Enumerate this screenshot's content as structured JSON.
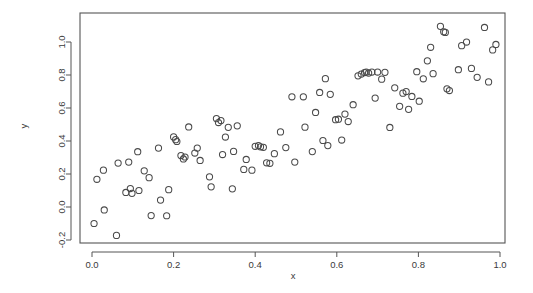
{
  "chart_data": {
    "type": "scatter",
    "title": "",
    "subtitle": "",
    "xlabel": "x",
    "ylabel": "y",
    "xlim": [
      -0.04,
      1.04
    ],
    "ylim": [
      -0.235,
      1.135
    ],
    "xticks": [
      0.0,
      0.2,
      0.4,
      0.6,
      0.8,
      1.0
    ],
    "xtick_labels": [
      "0.0",
      "0.2",
      "0.4",
      "0.6",
      "0.8",
      "1.0"
    ],
    "yticks": [
      -0.2,
      0.0,
      0.2,
      0.4,
      0.6,
      0.8,
      1.0
    ],
    "ytick_labels": [
      "-0.2",
      "0.0",
      "0.2",
      "0.4",
      "0.6",
      "0.8",
      "1.0"
    ],
    "grid": false,
    "legend": null,
    "marker": "open-circle",
    "marker_color": "#4a4a4a",
    "marker_size": 3.1,
    "frame": true,
    "annotations": [],
    "n_points": 103,
    "points": [
      [
        0.005,
        -0.1
      ],
      [
        0.012,
        0.168
      ],
      [
        0.028,
        0.223
      ],
      [
        0.03,
        -0.018
      ],
      [
        0.06,
        -0.172
      ],
      [
        0.064,
        0.266
      ],
      [
        0.083,
        0.088
      ],
      [
        0.09,
        0.272
      ],
      [
        0.094,
        0.112
      ],
      [
        0.098,
        0.083
      ],
      [
        0.112,
        0.335
      ],
      [
        0.115,
        0.1
      ],
      [
        0.128,
        0.219
      ],
      [
        0.14,
        0.178
      ],
      [
        0.145,
        -0.052
      ],
      [
        0.163,
        0.357
      ],
      [
        0.168,
        0.042
      ],
      [
        0.183,
        -0.053
      ],
      [
        0.188,
        0.105
      ],
      [
        0.2,
        0.425
      ],
      [
        0.205,
        0.408
      ],
      [
        0.208,
        0.397
      ],
      [
        0.218,
        0.312
      ],
      [
        0.224,
        0.291
      ],
      [
        0.228,
        0.303
      ],
      [
        0.237,
        0.485
      ],
      [
        0.252,
        0.327
      ],
      [
        0.258,
        0.357
      ],
      [
        0.265,
        0.282
      ],
      [
        0.288,
        0.183
      ],
      [
        0.292,
        0.122
      ],
      [
        0.305,
        0.536
      ],
      [
        0.31,
        0.512
      ],
      [
        0.316,
        0.524
      ],
      [
        0.32,
        0.318
      ],
      [
        0.327,
        0.424
      ],
      [
        0.334,
        0.483
      ],
      [
        0.344,
        0.11
      ],
      [
        0.347,
        0.337
      ],
      [
        0.356,
        0.492
      ],
      [
        0.372,
        0.228
      ],
      [
        0.378,
        0.288
      ],
      [
        0.392,
        0.223
      ],
      [
        0.4,
        0.368
      ],
      [
        0.408,
        0.372
      ],
      [
        0.413,
        0.365
      ],
      [
        0.42,
        0.362
      ],
      [
        0.428,
        0.268
      ],
      [
        0.436,
        0.265
      ],
      [
        0.447,
        0.323
      ],
      [
        0.462,
        0.455
      ],
      [
        0.475,
        0.36
      ],
      [
        0.49,
        0.668
      ],
      [
        0.497,
        0.272
      ],
      [
        0.518,
        0.668
      ],
      [
        0.522,
        0.484
      ],
      [
        0.54,
        0.336
      ],
      [
        0.548,
        0.573
      ],
      [
        0.558,
        0.694
      ],
      [
        0.566,
        0.403
      ],
      [
        0.572,
        0.778
      ],
      [
        0.578,
        0.372
      ],
      [
        0.584,
        0.683
      ],
      [
        0.597,
        0.529
      ],
      [
        0.604,
        0.532
      ],
      [
        0.612,
        0.406
      ],
      [
        0.62,
        0.563
      ],
      [
        0.628,
        0.518
      ],
      [
        0.64,
        0.62
      ],
      [
        0.652,
        0.795
      ],
      [
        0.66,
        0.806
      ],
      [
        0.668,
        0.815
      ],
      [
        0.672,
        0.818
      ],
      [
        0.678,
        0.812
      ],
      [
        0.686,
        0.818
      ],
      [
        0.694,
        0.66
      ],
      [
        0.7,
        0.818
      ],
      [
        0.71,
        0.775
      ],
      [
        0.718,
        0.816
      ],
      [
        0.73,
        0.482
      ],
      [
        0.742,
        0.722
      ],
      [
        0.754,
        0.61
      ],
      [
        0.762,
        0.69
      ],
      [
        0.77,
        0.7
      ],
      [
        0.776,
        0.592
      ],
      [
        0.784,
        0.67
      ],
      [
        0.796,
        0.82
      ],
      [
        0.802,
        0.641
      ],
      [
        0.812,
        0.777
      ],
      [
        0.822,
        0.886
      ],
      [
        0.83,
        0.968
      ],
      [
        0.836,
        0.808
      ],
      [
        0.854,
        1.095
      ],
      [
        0.862,
        1.062
      ],
      [
        0.866,
        1.058
      ],
      [
        0.87,
        0.716
      ],
      [
        0.876,
        0.706
      ],
      [
        0.898,
        0.832
      ],
      [
        0.906,
        0.978
      ],
      [
        0.918,
        1.0
      ],
      [
        0.93,
        0.84
      ],
      [
        0.944,
        0.786
      ],
      [
        0.962,
        1.088
      ],
      [
        0.972,
        0.758
      ],
      [
        0.982,
        0.952
      ],
      [
        0.99,
        0.985
      ]
    ]
  },
  "geometry": {
    "plot_left": 80,
    "plot_right": 505,
    "plot_top": 13,
    "plot_bottom": 243,
    "x0_px": 92,
    "x1_px": 500,
    "y0_px": 207,
    "y1_px": 42,
    "xlabel_x": 293,
    "xlabel_y": 279,
    "ylabel_x": 27,
    "ylabel_y": 126
  }
}
